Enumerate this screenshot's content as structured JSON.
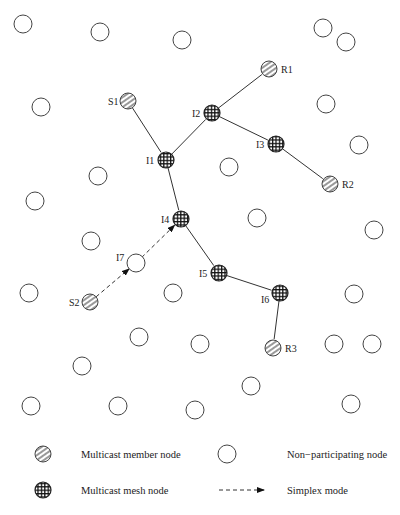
{
  "diagram": {
    "type": "multicast-mesh-network",
    "node_radius": 8,
    "labeled_nodes": [
      {
        "id": "S1",
        "label": "S1",
        "kind": "member",
        "x": 128,
        "y": 101,
        "label_dx": -20,
        "label_dy": 4
      },
      {
        "id": "R1",
        "label": "R1",
        "kind": "member",
        "x": 269,
        "y": 69,
        "label_dx": 12,
        "label_dy": 4
      },
      {
        "id": "R2",
        "label": "R2",
        "kind": "member",
        "x": 330,
        "y": 184,
        "label_dx": 12,
        "label_dy": 4
      },
      {
        "id": "S2",
        "label": "S2",
        "kind": "member",
        "x": 90,
        "y": 302,
        "label_dx": -21,
        "label_dy": 4
      },
      {
        "id": "R3",
        "label": "R3",
        "kind": "member",
        "x": 273,
        "y": 348,
        "label_dx": 12,
        "label_dy": 4
      },
      {
        "id": "I1",
        "label": "I1",
        "kind": "mesh",
        "x": 166,
        "y": 160,
        "label_dx": -20,
        "label_dy": 4
      },
      {
        "id": "I2",
        "label": "I2",
        "kind": "mesh",
        "x": 212,
        "y": 113,
        "label_dx": -20,
        "label_dy": 4
      },
      {
        "id": "I3",
        "label": "I3",
        "kind": "mesh",
        "x": 276,
        "y": 144,
        "label_dx": -20,
        "label_dy": 4
      },
      {
        "id": "I4",
        "label": "I4",
        "kind": "mesh",
        "x": 181,
        "y": 219,
        "label_dx": -20,
        "label_dy": 4
      },
      {
        "id": "I5",
        "label": "I5",
        "kind": "mesh",
        "x": 219,
        "y": 273,
        "label_dx": -20,
        "label_dy": 4
      },
      {
        "id": "I6",
        "label": "I6",
        "kind": "mesh",
        "x": 280,
        "y": 293,
        "label_dx": -19,
        "label_dy": 10
      },
      {
        "id": "I7",
        "label": "I7",
        "kind": "plain",
        "x": 136,
        "y": 263,
        "label_dx": -20,
        "label_dy": -2
      }
    ],
    "edges": [
      {
        "from": "S1",
        "to": "I1",
        "style": "solid"
      },
      {
        "from": "I1",
        "to": "I2",
        "style": "solid"
      },
      {
        "from": "I2",
        "to": "R1",
        "style": "solid"
      },
      {
        "from": "I2",
        "to": "I3",
        "style": "solid"
      },
      {
        "from": "I3",
        "to": "R2",
        "style": "solid"
      },
      {
        "from": "I1",
        "to": "I4",
        "style": "solid"
      },
      {
        "from": "I4",
        "to": "I5",
        "style": "solid"
      },
      {
        "from": "I5",
        "to": "I6",
        "style": "solid"
      },
      {
        "from": "I6",
        "to": "R3",
        "style": "solid"
      },
      {
        "from": "S2",
        "to": "I7",
        "style": "dashed-arrow"
      },
      {
        "from": "I7",
        "to": "I4",
        "style": "dashed-arrow"
      }
    ],
    "non_participating_nodes": [
      [
        23,
        24
      ],
      [
        100,
        32
      ],
      [
        182,
        40
      ],
      [
        323,
        28
      ],
      [
        346,
        42
      ],
      [
        41,
        107
      ],
      [
        326,
        104
      ],
      [
        229,
        167
      ],
      [
        98,
        176
      ],
      [
        359,
        145
      ],
      [
        35,
        201
      ],
      [
        257,
        218
      ],
      [
        374,
        230
      ],
      [
        91,
        241
      ],
      [
        29,
        293
      ],
      [
        173,
        293
      ],
      [
        354,
        294
      ],
      [
        139,
        337
      ],
      [
        200,
        344
      ],
      [
        334,
        344
      ],
      [
        372,
        344
      ],
      [
        82,
        366
      ],
      [
        251,
        386
      ],
      [
        31,
        406
      ],
      [
        118,
        406
      ],
      [
        195,
        410
      ],
      [
        351,
        404
      ]
    ]
  },
  "legend": {
    "items": [
      {
        "symbol": "member",
        "label": "Multicast member node"
      },
      {
        "symbol": "plain",
        "label": "Non−participating node"
      },
      {
        "symbol": "mesh",
        "label": "Multicast mesh node"
      },
      {
        "symbol": "dashed-arrow",
        "label": "Simplex mode"
      }
    ]
  }
}
